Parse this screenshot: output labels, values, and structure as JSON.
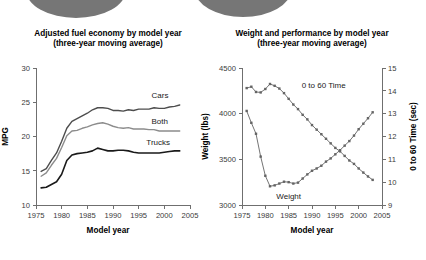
{
  "figure": {
    "width": 426,
    "height": 260,
    "background": "#ffffff",
    "decoration": {
      "name": "gray-ellipse-banner",
      "color": "#767676",
      "shapes": [
        {
          "cx": 76,
          "cy": -10,
          "rx": 50,
          "ry": 28
        },
        {
          "cx": 243,
          "cy": -10,
          "rx": 48,
          "ry": 27
        }
      ]
    }
  },
  "chart_data": [
    {
      "id": "fuel-economy",
      "type": "line",
      "title": "Adjusted fuel economy by model year",
      "subtitle": "(three-year moving average)",
      "xlabel": "Model year",
      "ylabel": "MPG",
      "xlim": [
        1975,
        2005
      ],
      "ylim": [
        10,
        30
      ],
      "xticks": [
        1975,
        1980,
        1985,
        1990,
        1995,
        2000,
        2005
      ],
      "xticklabels": [
        "1975",
        "1980",
        "1985",
        "1990",
        "1995",
        "2000",
        "2005"
      ],
      "yticks": [
        10,
        15,
        20,
        25,
        30
      ],
      "yticklabels": [
        "10",
        "15",
        "20",
        "25",
        "30"
      ],
      "grid": false,
      "legend_position": "inline-right",
      "x": [
        1976,
        1977,
        1978,
        1979,
        1980,
        1981,
        1982,
        1983,
        1984,
        1985,
        1986,
        1987,
        1988,
        1989,
        1990,
        1991,
        1992,
        1993,
        1994,
        1995,
        1996,
        1997,
        1998,
        1999,
        2000,
        2001,
        2002,
        2003
      ],
      "series": [
        {
          "name": "Cars",
          "color": "#4d4d4d",
          "width": 1.4,
          "label_x": 1997.5,
          "label_y": 25.6,
          "values": [
            14.9,
            15.3,
            16.5,
            17.6,
            19.3,
            21.2,
            22.2,
            22.6,
            23.0,
            23.4,
            23.9,
            24.2,
            24.2,
            24.1,
            23.8,
            23.8,
            23.7,
            23.9,
            23.8,
            24.0,
            24.0,
            24.0,
            24.2,
            24.1,
            24.1,
            24.3,
            24.4,
            24.6
          ]
        },
        {
          "name": "Both",
          "color": "#8c8c8c",
          "width": 1.4,
          "label_x": 1997.5,
          "label_y": 21.8,
          "values": [
            14.2,
            14.7,
            15.8,
            16.8,
            18.4,
            20.1,
            20.8,
            20.9,
            21.2,
            21.4,
            21.7,
            21.9,
            22.0,
            21.8,
            21.5,
            21.3,
            21.2,
            21.3,
            21.1,
            21.1,
            21.1,
            21.0,
            21.0,
            20.8,
            20.8,
            20.8,
            20.8,
            20.8
          ]
        },
        {
          "name": "Trucks",
          "color": "#1a1a1a",
          "width": 1.6,
          "label_x": 1996.5,
          "label_y": 18.8,
          "values": [
            12.5,
            12.6,
            13.0,
            13.4,
            14.5,
            16.5,
            17.3,
            17.5,
            17.6,
            17.7,
            17.9,
            18.3,
            18.1,
            17.9,
            17.9,
            18.0,
            18.0,
            17.9,
            17.7,
            17.6,
            17.6,
            17.6,
            17.6,
            17.6,
            17.7,
            17.8,
            17.9,
            17.9
          ]
        }
      ]
    },
    {
      "id": "weight-performance",
      "type": "line",
      "title": "Weight and performance by model year",
      "subtitle": "(three-year moving average)",
      "xlabel": "Model year",
      "ylabel": "Weight (lbs)",
      "y2label": "0 to 60 Time (sec)",
      "xlim": [
        1975,
        2005
      ],
      "ylim": [
        3000,
        4500
      ],
      "y2lim": [
        9,
        15
      ],
      "xticks": [
        1975,
        1980,
        1985,
        1990,
        1995,
        2000,
        2005
      ],
      "xticklabels": [
        "1975",
        "1980",
        "1985",
        "1990",
        "1995",
        "2000",
        "2005"
      ],
      "yticks": [
        3000,
        3500,
        4000,
        4500
      ],
      "yticklabels": [
        "3000",
        "3500",
        "4000",
        "4500"
      ],
      "y2ticks": [
        9,
        10,
        11,
        12,
        13,
        14,
        15
      ],
      "y2ticklabels": [
        "9",
        "10",
        "11",
        "12",
        "13",
        "14",
        "15"
      ],
      "grid": false,
      "marker": "square",
      "legend_position": "inline",
      "x": [
        1976,
        1977,
        1978,
        1979,
        1980,
        1981,
        1982,
        1983,
        1984,
        1985,
        1986,
        1987,
        1988,
        1989,
        1990,
        1991,
        1992,
        1993,
        1994,
        1995,
        1996,
        1997,
        1998,
        1999,
        2000,
        2001,
        2002,
        2003
      ],
      "series": [
        {
          "name": "Weight",
          "axis": "left",
          "color": "#646464",
          "width": 0.9,
          "label_x": 1985.0,
          "label_y": 3065,
          "values": [
            4030,
            3900,
            3780,
            3530,
            3320,
            3205,
            3215,
            3235,
            3255,
            3250,
            3235,
            3245,
            3290,
            3335,
            3375,
            3400,
            3430,
            3475,
            3510,
            3555,
            3600,
            3650,
            3700,
            3760,
            3830,
            3890,
            3950,
            4015
          ]
        },
        {
          "name": "0 to 60 Time",
          "axis": "right",
          "color": "#646464",
          "width": 0.9,
          "label_x": 1992.5,
          "label_y": 14.12,
          "values": [
            14.12,
            14.18,
            13.95,
            13.93,
            14.08,
            14.3,
            14.22,
            14.1,
            13.9,
            13.65,
            13.4,
            13.2,
            12.95,
            12.75,
            12.5,
            12.3,
            12.1,
            11.9,
            11.7,
            11.5,
            11.35,
            11.15,
            10.95,
            10.8,
            10.6,
            10.42,
            10.25,
            10.1
          ]
        }
      ]
    }
  ]
}
